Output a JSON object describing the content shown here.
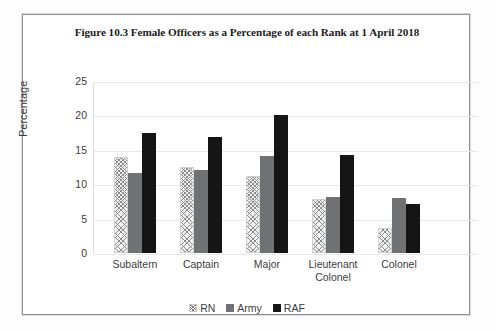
{
  "chart_data": {
    "type": "bar",
    "title": "Figure 10.3 Female Officers as a Percentage of each Rank at 1 April 2018",
    "xlabel": "",
    "ylabel": "Percentage",
    "ylim": [
      0,
      25
    ],
    "yticks": [
      "0",
      "5",
      "10",
      "15",
      "20",
      "25"
    ],
    "ytick_values": [
      0,
      5,
      10,
      15,
      20,
      25
    ],
    "grid": true,
    "legend_position": "bottom",
    "categories": [
      "Subaltern",
      "Captain",
      "Major",
      "Lieutenant Colonel",
      "Colonel"
    ],
    "series": [
      {
        "name": "RN",
        "color": "#f2f2f2",
        "pattern": "cross-hatch",
        "values": [
          13.9,
          12.5,
          11.2,
          7.8,
          3.6
        ]
      },
      {
        "name": "Army",
        "color": "#6f7173",
        "pattern": "dotted-grey",
        "values": [
          11.7,
          12.0,
          14.1,
          8.2,
          8.0
        ]
      },
      {
        "name": "RAF",
        "color": "#151516",
        "pattern": "dotted-black",
        "values": [
          17.5,
          16.8,
          20.0,
          14.2,
          7.1
        ]
      }
    ]
  },
  "legend": {
    "items": [
      {
        "label": "RN"
      },
      {
        "label": "Army"
      },
      {
        "label": "RAF"
      }
    ]
  }
}
